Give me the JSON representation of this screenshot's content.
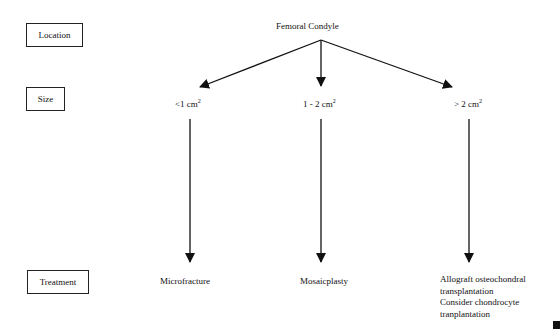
{
  "row_labels": {
    "location": "Location",
    "size": "Size",
    "treatment": "Treatment"
  },
  "root": {
    "label": "Femoral Condyle"
  },
  "branches": [
    {
      "size_value": "<1 cm",
      "size_unit_sup": "2",
      "treatment": [
        "Microfracture"
      ]
    },
    {
      "size_value": "1 - 2 cm",
      "size_unit_sup": "2",
      "treatment": [
        "Mosaicplasty"
      ]
    },
    {
      "size_value": "> 2 cm",
      "size_unit_sup": "2",
      "treatment": [
        "Allograft osteochondral",
        "transplantation",
        "Consider chondrocyte",
        "tranplantation"
      ]
    }
  ]
}
